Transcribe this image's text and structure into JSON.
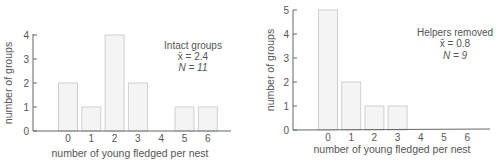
{
  "chart_data": [
    {
      "type": "bar",
      "title": "",
      "legend_text": [
        "Intact groups",
        "x̄ = 2.4",
        "N = 11"
      ],
      "categories": [
        "0",
        "1",
        "2",
        "3",
        "4",
        "5",
        "6"
      ],
      "values": [
        2,
        1,
        4,
        2,
        0,
        1,
        1
      ],
      "xlabel": "number of young fledged per nest",
      "ylabel": "number of groups",
      "yticks": [
        "0",
        "1",
        "2",
        "3",
        "4"
      ],
      "ylim": [
        0,
        4
      ],
      "grid": false,
      "legend_position": "upper right",
      "bar_fill": "#f4f4f4",
      "bar_stroke": "#cfcfcf"
    },
    {
      "type": "bar",
      "title": "",
      "legend_text": [
        "Helpers removed",
        "x̄ = 0.8",
        "N = 9"
      ],
      "categories": [
        "0",
        "1",
        "2",
        "3",
        "4",
        "5",
        "6"
      ],
      "values": [
        5,
        2,
        1,
        1,
        0,
        0,
        0
      ],
      "xlabel": "number of young fledged per nest",
      "ylabel": "number of groups",
      "yticks": [
        "0",
        "1",
        "2",
        "3",
        "4",
        "5"
      ],
      "ylim": [
        0,
        5
      ],
      "grid": false,
      "legend_position": "upper right",
      "bar_fill": "#f4f4f4",
      "bar_stroke": "#cfcfcf"
    }
  ]
}
